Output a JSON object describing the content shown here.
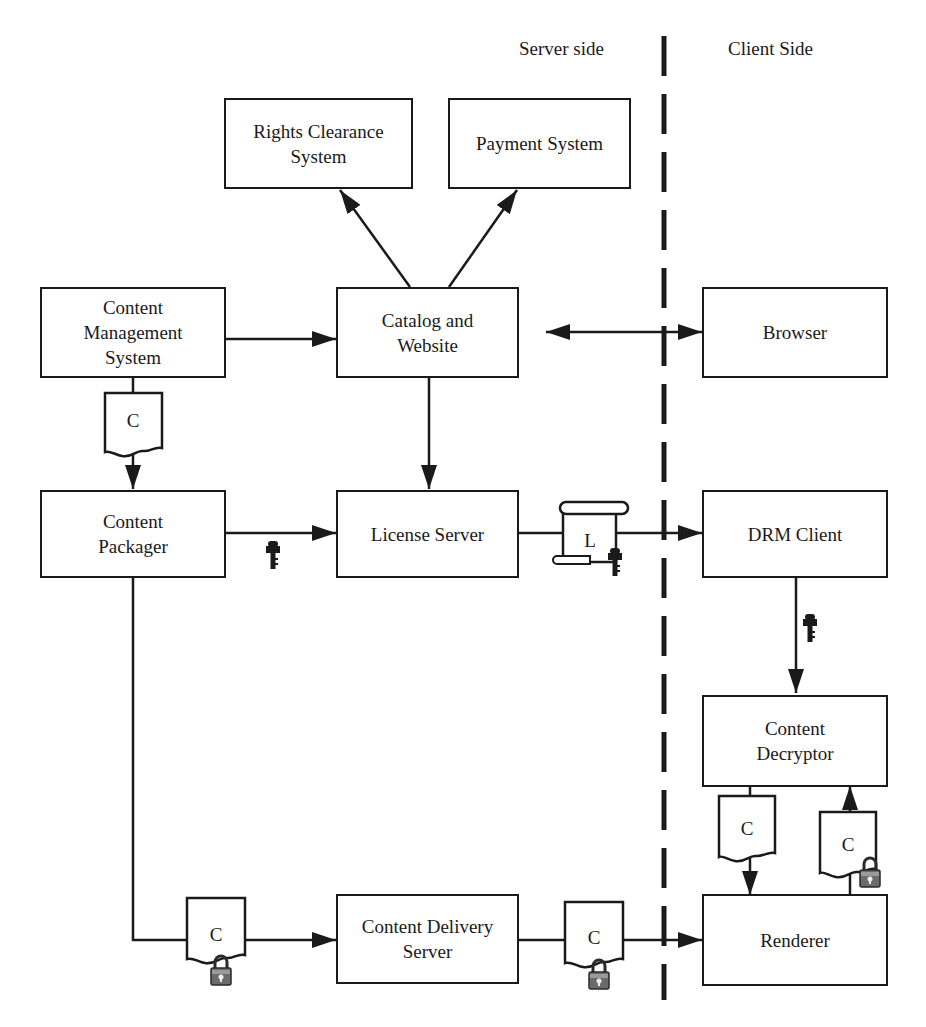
{
  "diagram": {
    "regions": {
      "server_side": "Server side",
      "client_side": "Client Side"
    },
    "nodes": {
      "rights_clearance": "Rights Clearance\nSystem",
      "payment": "Payment System",
      "cms": "Content\nManagement\nSystem",
      "catalog": "Catalog and\nWebsite",
      "browser": "Browser",
      "packager": "Content\nPackager",
      "license_server": "License Server",
      "drm_client": "DRM Client",
      "decryptor": "Content\nDecryptor",
      "delivery": "Content Delivery\nServer",
      "renderer": "Renderer"
    },
    "tokens": {
      "content": "C",
      "license": "L"
    },
    "icons": [
      "document-icon",
      "license-scroll-icon",
      "key-icon",
      "padlock-icon"
    ],
    "edges": [
      {
        "from": "Catalog and Website",
        "to": "Rights Clearance System"
      },
      {
        "from": "Catalog and Website",
        "to": "Payment System"
      },
      {
        "from": "Content Management System",
        "to": "Catalog and Website"
      },
      {
        "from": "Catalog and Website",
        "to": "Browser",
        "bidirectional": true
      },
      {
        "from": "Content Management System",
        "to": "Content Packager",
        "carries": "C"
      },
      {
        "from": "Catalog and Website",
        "to": "License Server"
      },
      {
        "from": "Content Packager",
        "to": "License Server",
        "carries": "key"
      },
      {
        "from": "License Server",
        "to": "DRM Client",
        "carries": "L + key"
      },
      {
        "from": "DRM Client",
        "to": "Content Decryptor",
        "carries": "key"
      },
      {
        "from": "Content Packager",
        "to": "Content Delivery Server",
        "carries": "C (locked)"
      },
      {
        "from": "Content Delivery Server",
        "to": "Renderer",
        "carries": "C (locked)"
      },
      {
        "from": "Renderer",
        "to": "Content Decryptor",
        "carries": "C (locked)"
      },
      {
        "from": "Content Decryptor",
        "to": "Renderer",
        "carries": "C"
      }
    ],
    "colors": {
      "stroke": "#1a1a1a",
      "background": "#ffffff",
      "lock": "#6b6b6b"
    }
  }
}
